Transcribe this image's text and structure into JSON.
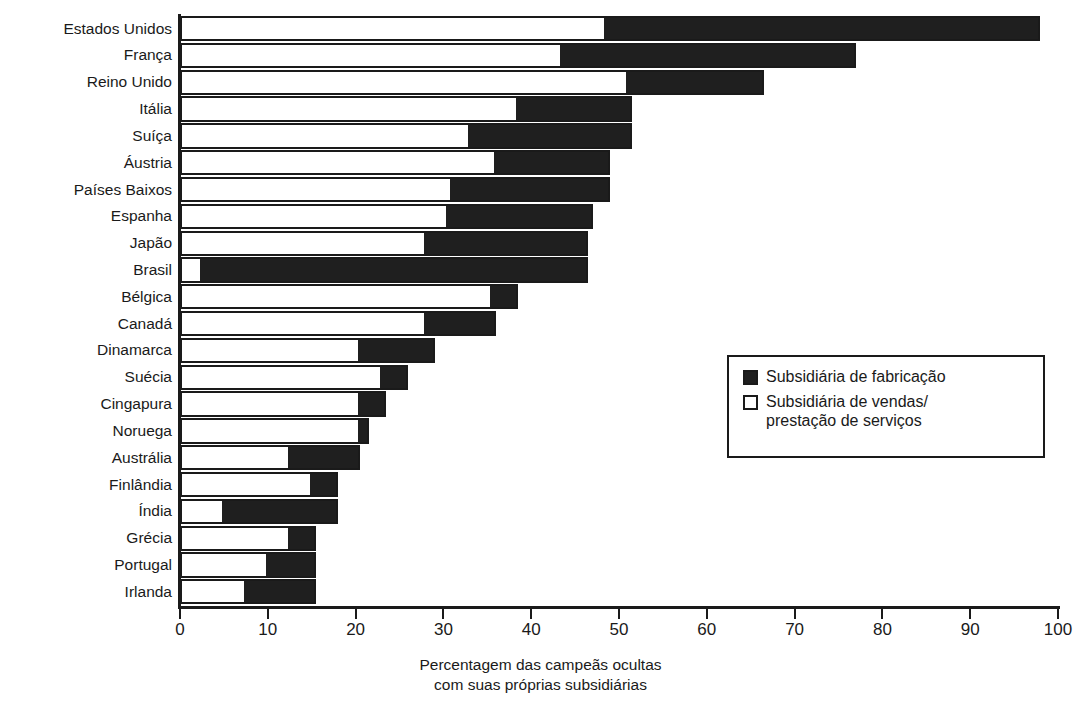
{
  "chart_data": {
    "type": "bar",
    "orientation": "horizontal",
    "stacked": true,
    "title": "",
    "xlabel_lines": [
      "Percentagem das campeãs ocultas",
      "com suas próprias subsidiárias"
    ],
    "ylabel": "",
    "xlim": [
      0,
      100
    ],
    "xticks": [
      0,
      10,
      20,
      30,
      40,
      50,
      60,
      70,
      80,
      90,
      100
    ],
    "grid": false,
    "legend_position": "middle-right",
    "categories": [
      "Estados Unidos",
      "França",
      "Reino Unido",
      "Itália",
      "Suíça",
      "Áustria",
      "Países Baixos",
      "Espanha",
      "Japão",
      "Brasil",
      "Bélgica",
      "Canadá",
      "Dinamarca",
      "Suécia",
      "Cingapura",
      "Noruega",
      "Austrália",
      "Finlândia",
      "Índia",
      "Grécia",
      "Portugal",
      "Irlanda"
    ],
    "series": [
      {
        "name": "Subsidiária de vendas/ prestação de serviços",
        "color": "#ffffff",
        "values": [
          48.5,
          43.5,
          51.0,
          38.5,
          33.0,
          36.0,
          31.0,
          30.5,
          28.0,
          2.5,
          35.5,
          28.0,
          20.5,
          23.0,
          20.5,
          20.5,
          12.5,
          15.0,
          5.0,
          12.5,
          10.0,
          7.5
        ]
      },
      {
        "name": "Subsidiária de fabricação",
        "color": "#1f1f1f",
        "values": [
          49.5,
          33.5,
          15.5,
          13.0,
          18.5,
          13.0,
          18.0,
          16.5,
          18.5,
          44.0,
          3.0,
          8.0,
          8.5,
          3.0,
          3.0,
          1.0,
          8.0,
          3.0,
          13.0,
          3.0,
          5.5,
          8.0
        ]
      }
    ],
    "totals": [
      98.0,
      77.0,
      66.5,
      51.5,
      51.5,
      49.0,
      49.0,
      47.0,
      46.5,
      46.5,
      38.5,
      36.0,
      29.0,
      26.0,
      23.5,
      21.5,
      20.5,
      18.0,
      18.0,
      15.5,
      15.5,
      15.5
    ]
  },
  "legend": {
    "items": [
      {
        "swatch": "filled",
        "lines": [
          "Subsidiária de fabricação"
        ]
      },
      {
        "swatch": "hollow",
        "lines": [
          "Subsidiária de vendas/",
          "prestação de serviços"
        ]
      }
    ]
  },
  "colors": {
    "manufacturing": "#1f1f1f",
    "sales": "#ffffff",
    "axis": "#1a1a1a",
    "background": "#ffffff"
  }
}
